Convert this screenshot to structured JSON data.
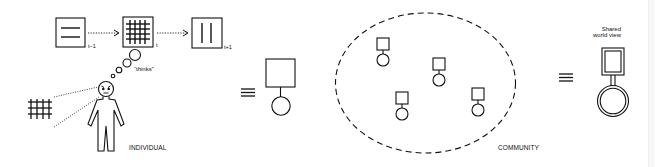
{
  "diagram": {
    "colors": {
      "stroke": "#111111",
      "background": "#ffffff"
    },
    "individual": {
      "time_labels": [
        "t−1",
        "t",
        "t+1"
      ],
      "thought_label": "“thinks”",
      "caption": "INDIVIDUAL"
    },
    "equivalence_symbol": "≡",
    "community": {
      "caption": "COMMUNITY",
      "member_count": 4
    },
    "shared": {
      "label_line1": "Shared",
      "label_line2": "world view"
    }
  }
}
